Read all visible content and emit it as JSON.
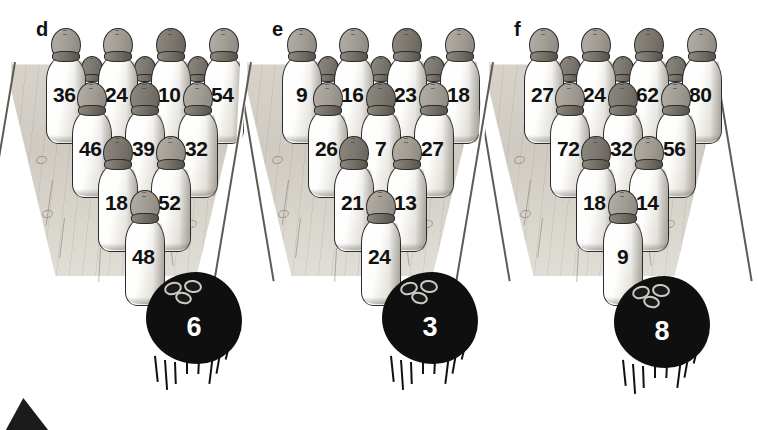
{
  "page": {
    "background": "#ffffff"
  },
  "groups": [
    {
      "label": "d",
      "ball": {
        "name": "ball-6",
        "value": "6"
      },
      "rows": [
        {
          "row": 1,
          "pins": [
            {
              "value": "36",
              "dark": false
            },
            {
              "value": "24",
              "dark": false
            },
            {
              "value": "10",
              "dark": true
            },
            {
              "value": "54",
              "dark": false
            }
          ]
        },
        {
          "row": 2,
          "pins": [
            {
              "value": "46",
              "dark": false
            },
            {
              "value": "39",
              "dark": true
            },
            {
              "value": "32",
              "dark": false
            }
          ]
        },
        {
          "row": 3,
          "pins": [
            {
              "value": "18",
              "dark": true
            },
            {
              "value": "52",
              "dark": false
            }
          ]
        },
        {
          "row": 4,
          "pins": [
            {
              "value": "48",
              "dark": false
            }
          ]
        }
      ]
    },
    {
      "label": "e",
      "ball": {
        "name": "ball-3",
        "value": "3"
      },
      "rows": [
        {
          "row": 1,
          "pins": [
            {
              "value": "9",
              "dark": false
            },
            {
              "value": "16",
              "dark": false
            },
            {
              "value": "23",
              "dark": true
            },
            {
              "value": "18",
              "dark": false
            }
          ]
        },
        {
          "row": 2,
          "pins": [
            {
              "value": "26",
              "dark": false
            },
            {
              "value": "7",
              "dark": true
            },
            {
              "value": "27",
              "dark": false
            }
          ]
        },
        {
          "row": 3,
          "pins": [
            {
              "value": "21",
              "dark": true
            },
            {
              "value": "13",
              "dark": false
            }
          ]
        },
        {
          "row": 4,
          "pins": [
            {
              "value": "24",
              "dark": false
            }
          ]
        }
      ]
    },
    {
      "label": "f",
      "ball": {
        "name": "ball-8",
        "value": "8"
      },
      "rows": [
        {
          "row": 1,
          "pins": [
            {
              "value": "27",
              "dark": false
            },
            {
              "value": "24",
              "dark": false
            },
            {
              "value": "62",
              "dark": true
            },
            {
              "value": "80",
              "dark": false
            }
          ]
        },
        {
          "row": 2,
          "pins": [
            {
              "value": "72",
              "dark": false
            },
            {
              "value": "32",
              "dark": true
            },
            {
              "value": "56",
              "dark": false
            }
          ]
        },
        {
          "row": 3,
          "pins": [
            {
              "value": "18",
              "dark": true
            },
            {
              "value": "14",
              "dark": false
            }
          ]
        },
        {
          "row": 4,
          "pins": [
            {
              "value": "9",
              "dark": false
            }
          ]
        }
      ]
    }
  ],
  "corner_marker": {
    "name": "page-corner-triangle"
  }
}
